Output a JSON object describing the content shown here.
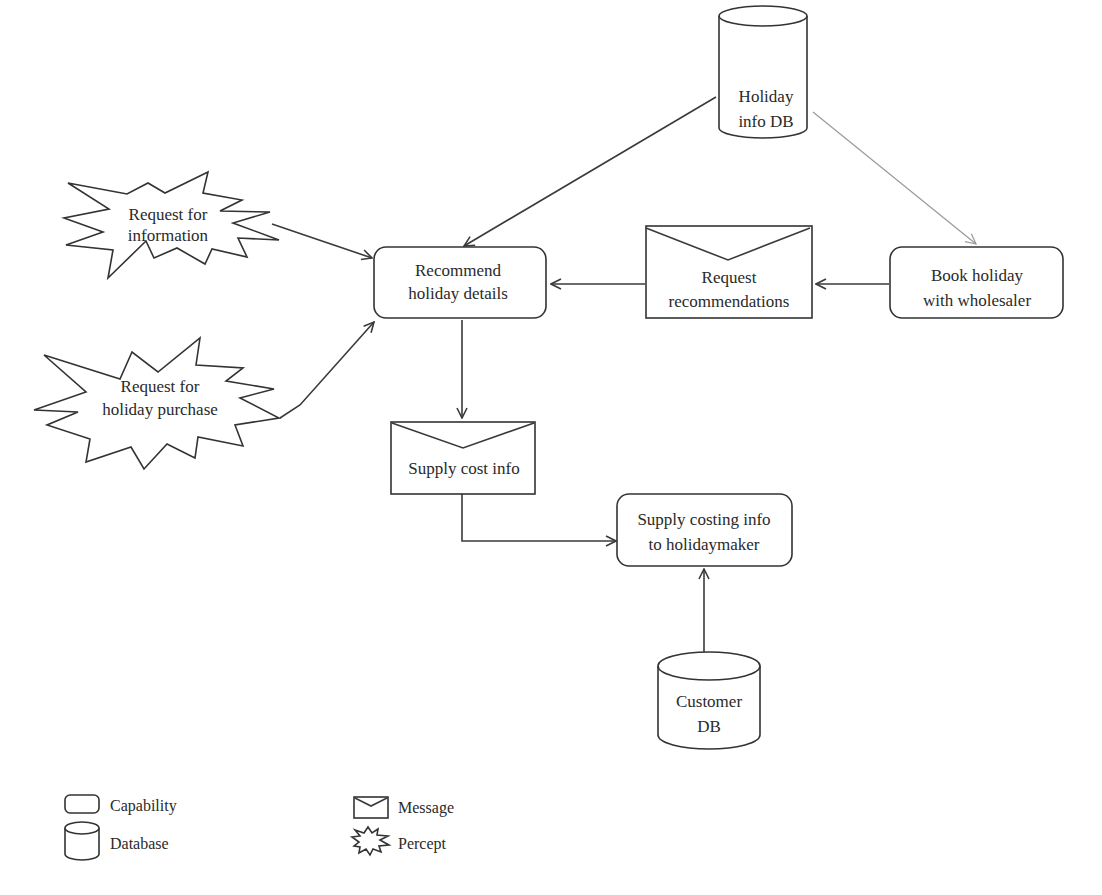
{
  "diagram": {
    "type": "capability-overview",
    "nodes": {
      "holiday_info_db": {
        "kind": "database",
        "line1": "Holiday",
        "line2": "info DB"
      },
      "request_for_information": {
        "kind": "percept",
        "line1": "Request for",
        "line2": "information"
      },
      "request_for_holiday_purchase": {
        "kind": "percept",
        "line1": "Request for",
        "line2": "holiday purchase"
      },
      "recommend_holiday_details": {
        "kind": "capability",
        "line1": "Recommend",
        "line2": "holiday details"
      },
      "request_recommendations": {
        "kind": "message",
        "line1": "Request",
        "line2": "recommendations"
      },
      "book_holiday_with_wholesaler": {
        "kind": "capability",
        "line1": "Book holiday",
        "line2": "with wholesaler"
      },
      "supply_cost_info": {
        "kind": "message",
        "line1": "Supply cost info"
      },
      "supply_costing_info_to_holidaymaker": {
        "kind": "capability",
        "line1": "Supply costing info",
        "line2": "to holidaymaker"
      },
      "customer_db": {
        "kind": "database",
        "line1": "Customer",
        "line2": "DB"
      }
    },
    "edges": [
      {
        "from": "holiday_info_db",
        "to": "recommend_holiday_details"
      },
      {
        "from": "holiday_info_db",
        "to": "book_holiday_with_wholesaler",
        "style": "light"
      },
      {
        "from": "request_for_information",
        "to": "recommend_holiday_details"
      },
      {
        "from": "request_for_holiday_purchase",
        "to": "recommend_holiday_details"
      },
      {
        "from": "book_holiday_with_wholesaler",
        "to": "request_recommendations"
      },
      {
        "from": "request_recommendations",
        "to": "recommend_holiday_details"
      },
      {
        "from": "recommend_holiday_details",
        "to": "supply_cost_info"
      },
      {
        "from": "supply_cost_info",
        "to": "supply_costing_info_to_holidaymaker"
      },
      {
        "from": "customer_db",
        "to": "supply_costing_info_to_holidaymaker"
      }
    ]
  },
  "legend": {
    "capability": "Capability",
    "database": "Database",
    "message": "Message",
    "percept": "Percept"
  }
}
